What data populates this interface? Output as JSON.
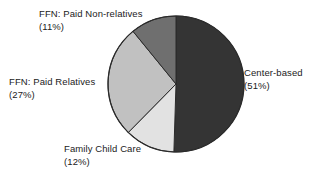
{
  "chart_data": {
    "type": "pie",
    "title": "",
    "subtitle": "",
    "xlabel": "",
    "ylabel": "",
    "legend_position": "none",
    "grid": false,
    "units": "percent",
    "total": 101,
    "start_angle_deg": 0,
    "direction": "clockwise",
    "slices": [
      {
        "label": "Center-based",
        "percent_text": "(51%)",
        "value": 51,
        "color": "#343434",
        "label_position": "right"
      },
      {
        "label": "Family Child Care",
        "percent_text": "(12%)",
        "value": 12,
        "color": "#e2e2e2",
        "label_position": "bottom"
      },
      {
        "label": "FFN: Paid Relatives",
        "percent_text": "(27%)",
        "value": 27,
        "color": "#c1c1c1",
        "label_position": "left"
      },
      {
        "label": "FFN: Paid Non-relatives",
        "percent_text": "(11%)",
        "value": 11,
        "color": "#6f6f6f",
        "label_position": "top-left"
      }
    ],
    "categories": [
      "Center-based",
      "Family Child Care",
      "FFN: Paid Relatives",
      "FFN: Paid Non-relatives"
    ],
    "values": [
      51,
      12,
      27,
      11
    ],
    "geometry": {
      "center_x": 176,
      "center_y": 84,
      "radius": 68,
      "outline_color": "#2b2b2b"
    }
  },
  "labels": {
    "ffn_nonrelatives": {
      "name": "FFN: Paid Non-relatives",
      "percent": "(11%)"
    },
    "ffn_relatives": {
      "name": "FFN: Paid Relatives",
      "percent": "(27%)"
    },
    "family_child_care": {
      "name": "Family Child Care",
      "percent": "(12%)"
    },
    "center_based": {
      "name": "Center-based",
      "percent": "(51%)"
    }
  }
}
